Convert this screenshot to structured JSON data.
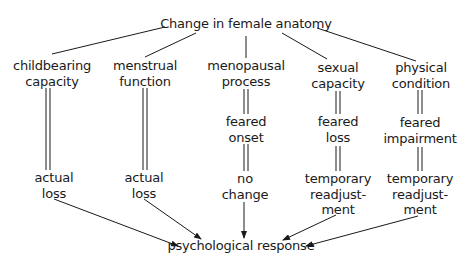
{
  "diagram": {
    "root": {
      "label": "Change in female anatomy"
    },
    "columns": [
      {
        "category": [
          "childbearing",
          "capacity"
        ],
        "stages": [
          [
            "actual",
            "loss"
          ]
        ]
      },
      {
        "category": [
          "menstrual",
          "function"
        ],
        "stages": [
          [
            "actual",
            "loss"
          ]
        ]
      },
      {
        "category": [
          "menopausal",
          "process"
        ],
        "stages": [
          [
            "feared",
            "onset"
          ],
          [
            "no",
            "change"
          ]
        ]
      },
      {
        "category": [
          "sexual",
          "capacity"
        ],
        "stages": [
          [
            "feared",
            "loss"
          ],
          [
            "temporary",
            "readjust-",
            "ment"
          ]
        ]
      },
      {
        "category": [
          "physical",
          "condition"
        ],
        "stages": [
          [
            "feared",
            "impairment"
          ],
          [
            "temporary",
            "readjust-",
            "ment"
          ]
        ]
      }
    ],
    "sink": {
      "label": "psychological response"
    },
    "colors": {
      "text": "#1a1a1a",
      "line": "#1a1a1a",
      "background": "#ffffff"
    }
  }
}
